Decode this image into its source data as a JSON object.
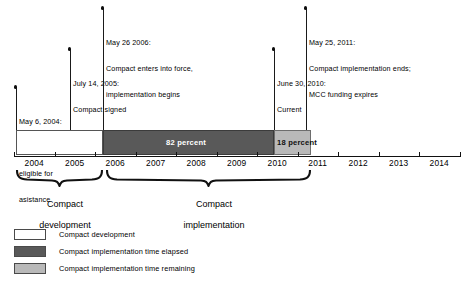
{
  "figure": {
    "type": "timeline",
    "axis": {
      "years": [
        "2004",
        "2005",
        "2006",
        "2007",
        "2008",
        "2009",
        "2010",
        "2011",
        "2012",
        "2013",
        "2014"
      ],
      "range": [
        2004,
        2015
      ]
    },
    "milestones": [
      {
        "id": "selected",
        "date": "May 6, 2004:",
        "lines": [
          "May 6, 2004:",
          "Selected as",
          "eligible for",
          "asistance"
        ],
        "year_position": 2004.35
      },
      {
        "id": "signed",
        "date": "July 14, 2005:",
        "lines": [
          "July 14, 2005:",
          "Compact signed"
        ],
        "year_position": 2005.53
      },
      {
        "id": "entry-into-force",
        "date": "May 26 2006:",
        "lines": [
          "May 26 2006:",
          "Compact enters into force,",
          "implementation begins"
        ],
        "year_position": 2006.4
      },
      {
        "id": "current",
        "date": "June 30, 2010:",
        "lines": [
          "June 30, 2010:",
          "Current"
        ],
        "year_position": 2010.5
      },
      {
        "id": "implementation-ends",
        "date": "May 25, 2011:",
        "lines": [
          "May 25, 2011:",
          "Compact implementation ends;",
          "MCC funding expires"
        ],
        "year_position": 2011.0
      }
    ],
    "bars": [
      {
        "id": "compact-development",
        "label": "",
        "style": "white",
        "start": 2004.1,
        "end": 2006.4
      },
      {
        "id": "time-elapsed",
        "label": "82 percent",
        "style": "dark",
        "start": 2006.4,
        "end": 2010.5
      },
      {
        "id": "time-remaining",
        "label": "18 percent",
        "style": "light",
        "start": 2010.5,
        "end": 2011.35
      }
    ],
    "braces": [
      {
        "id": "development",
        "lines": [
          "Compact",
          "development"
        ],
        "start": 2004.1,
        "end": 2006.4
      },
      {
        "id": "implementation",
        "lines": [
          "Compact",
          "implementation"
        ],
        "start": 2006.45,
        "end": 2011.35
      }
    ],
    "legend": [
      {
        "id": "compact-development",
        "swatch": "white",
        "label": "Compact development"
      },
      {
        "id": "time-elapsed",
        "swatch": "dark",
        "label": "Compact implementation time elapsed"
      },
      {
        "id": "time-remaining",
        "swatch": "light",
        "label": "Compact implementation time remaining"
      }
    ],
    "colors": {
      "elapsed": "#595959",
      "remaining": "#b9b9b9",
      "development": "#ffffff",
      "ink": "#111111"
    }
  }
}
